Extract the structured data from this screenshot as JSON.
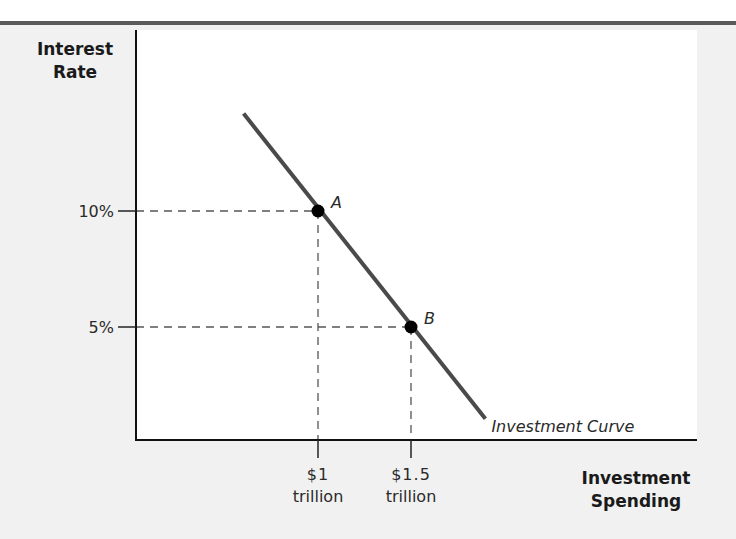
{
  "chart_data": {
    "type": "line",
    "title": "",
    "ylabel": "Interest Rate",
    "xlabel": "Investment Spending",
    "y_ticks": [
      {
        "value": 10,
        "label": "10%"
      },
      {
        "value": 5,
        "label": "5%"
      }
    ],
    "x_ticks": [
      {
        "value": 1.0,
        "label_line1": "$1",
        "label_line2": "trillion"
      },
      {
        "value": 1.5,
        "label_line1": "$1.5",
        "label_line2": "trillion"
      }
    ],
    "series": [
      {
        "name": "Investment Curve",
        "x": [
          0.6,
          1.9
        ],
        "y": [
          14.2,
          1.05
        ]
      }
    ],
    "points": [
      {
        "label": "A",
        "x": 1.0,
        "y": 10
      },
      {
        "label": "B",
        "x": 1.5,
        "y": 5
      }
    ],
    "xlim": [
      0,
      3.05
    ],
    "ylim": [
      0,
      19
    ],
    "grid": false,
    "guide_lines": "dashed lines from each point to both axes",
    "colors": {
      "curve": "#4a4a4a",
      "points": "#000000",
      "axes": "#111111",
      "guides": "#555555"
    }
  }
}
